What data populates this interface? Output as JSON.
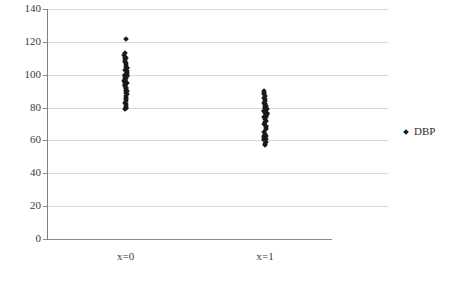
{
  "chart_data": {
    "type": "scatter",
    "title": "",
    "xlabel": "",
    "ylabel": "",
    "grid": true,
    "legend_position": "right",
    "ylim": [
      0,
      140
    ],
    "ytick_step": 20,
    "yticks": [
      140,
      120,
      100,
      80,
      60,
      40,
      20,
      0
    ],
    "ytick_labels": [
      "140",
      "120",
      "100",
      "80",
      "60",
      "40",
      "20",
      "0"
    ],
    "categories": [
      "x=0",
      "x=1"
    ],
    "xtick_labels": [
      "x=0",
      "x=1"
    ],
    "series": [
      {
        "name": "DBP",
        "marker": "diamond",
        "color": "#1a1a1a",
        "groups": [
          {
            "category": "x=0",
            "values": [
              122,
              113,
              112,
              111,
              110,
              110,
              109,
              108,
              107,
              106,
              105,
              104,
              104,
              103,
              102,
              101,
              100,
              100,
              100,
              99,
              99,
              98,
              98,
              97,
              97,
              96,
              96,
              95,
              95,
              95,
              94,
              94,
              93,
              92,
              92,
              91,
              90,
              90,
              89,
              88,
              87,
              86,
              85,
              84,
              83,
              82,
              81,
              80,
              80,
              79
            ]
          },
          {
            "category": "x=1",
            "values": [
              90,
              89,
              88,
              87,
              86,
              85,
              84,
              83,
              82,
              82,
              81,
              81,
              80,
              80,
              80,
              79,
              79,
              78,
              78,
              77,
              77,
              76,
              76,
              75,
              75,
              74,
              74,
              73,
              72,
              71,
              70,
              69,
              68,
              67,
              65,
              64,
              63,
              63,
              62,
              62,
              61,
              61,
              60,
              59,
              58,
              57
            ]
          }
        ]
      }
    ]
  },
  "legend": {
    "entries": [
      {
        "label": "DBP",
        "marker": "diamond-marker-icon"
      }
    ]
  },
  "axes": {
    "y_labels": [
      "140",
      "120",
      "100",
      "80",
      "60",
      "40",
      "20",
      "0"
    ],
    "x_labels": [
      "x=0",
      "x=1"
    ]
  }
}
